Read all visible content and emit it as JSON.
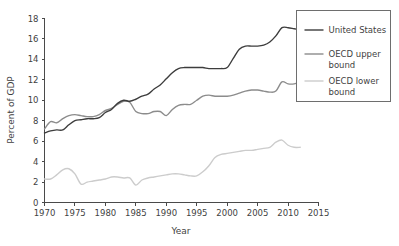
{
  "chart_data": {
    "type": "line",
    "title": "",
    "xlabel": "Year",
    "ylabel": "Percent of GDP",
    "xlim": [
      1970,
      2015
    ],
    "ylim": [
      0,
      18
    ],
    "xticks": [
      1970,
      1975,
      1980,
      1985,
      1990,
      1995,
      2000,
      2005,
      2010,
      2015
    ],
    "yticks": [
      0,
      2,
      4,
      6,
      8,
      10,
      12,
      14,
      16,
      18
    ],
    "grid": false,
    "legend_position": "top-right",
    "x": [
      1970,
      1971,
      1972,
      1973,
      1974,
      1975,
      1976,
      1977,
      1978,
      1979,
      1980,
      1981,
      1982,
      1983,
      1984,
      1985,
      1986,
      1987,
      1988,
      1989,
      1990,
      1991,
      1992,
      1993,
      1994,
      1995,
      1996,
      1997,
      1998,
      1999,
      2000,
      2001,
      2002,
      2003,
      2004,
      2005,
      2006,
      2007,
      2008,
      2009,
      2010,
      2011,
      2012
    ],
    "series": [
      {
        "name": "United States",
        "color": "#3d3d3d",
        "values": [
          6.8,
          7.0,
          7.1,
          7.1,
          7.6,
          8.0,
          8.1,
          8.2,
          8.2,
          8.3,
          8.8,
          9.1,
          9.7,
          10.0,
          9.9,
          10.1,
          10.4,
          10.6,
          11.1,
          11.5,
          12.1,
          12.7,
          13.1,
          13.2,
          13.2,
          13.2,
          13.2,
          13.1,
          13.1,
          13.1,
          13.2,
          14.1,
          15.0,
          15.3,
          15.3,
          15.3,
          15.4,
          15.7,
          16.3,
          17.1,
          17.1,
          17.0,
          16.9
        ]
      },
      {
        "name": "OECD upper bound",
        "color": "#8c8c8c",
        "values": [
          7.2,
          7.9,
          7.8,
          8.2,
          8.5,
          8.6,
          8.5,
          8.4,
          8.4,
          8.6,
          9.0,
          9.2,
          9.6,
          9.9,
          9.8,
          8.9,
          8.7,
          8.7,
          8.9,
          8.9,
          8.5,
          9.1,
          9.5,
          9.6,
          9.6,
          10.0,
          10.4,
          10.5,
          10.4,
          10.4,
          10.4,
          10.5,
          10.7,
          10.9,
          11.0,
          11.0,
          10.9,
          10.8,
          10.9,
          11.8,
          11.6,
          11.6,
          11.8
        ]
      },
      {
        "name": "OECD lower bound",
        "color": "#cccccc",
        "values": [
          2.3,
          2.3,
          2.7,
          3.2,
          3.3,
          2.8,
          1.8,
          2.0,
          2.1,
          2.2,
          2.3,
          2.5,
          2.5,
          2.4,
          2.4,
          1.7,
          2.2,
          2.4,
          2.5,
          2.6,
          2.7,
          2.8,
          2.8,
          2.7,
          2.6,
          2.6,
          3.0,
          3.6,
          4.4,
          4.7,
          4.8,
          4.9,
          5.0,
          5.1,
          5.1,
          5.2,
          5.3,
          5.4,
          5.9,
          6.1,
          5.6,
          5.4,
          5.4
        ]
      }
    ]
  },
  "legend": {
    "entries": [
      {
        "label": "United States",
        "color": "#3d3d3d"
      },
      {
        "label": "OECD upper bound",
        "color": "#8c8c8c"
      },
      {
        "label": "OECD lower bound",
        "color": "#cccccc"
      }
    ]
  },
  "axes": {
    "y_title": "Percent of GDP",
    "x_title": "Year"
  }
}
